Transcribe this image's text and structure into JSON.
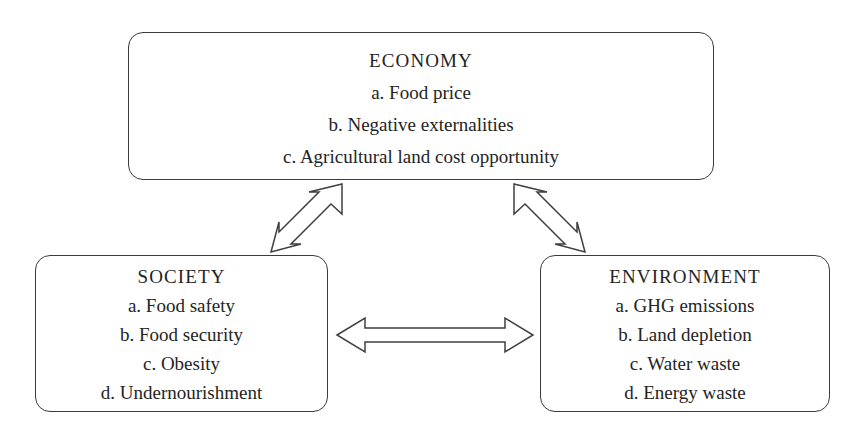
{
  "diagram": {
    "background_color": "#ffffff",
    "stroke_color": "#3f3f3f",
    "text_color": "#242424",
    "nodes": [
      {
        "id": "economy",
        "title": "ECONOMY",
        "items": [
          "a. Food price",
          "b. Negative externalities",
          "c. Agricultural land cost opportunity"
        ]
      },
      {
        "id": "society",
        "title": "SOCIETY",
        "items": [
          "a. Food safety",
          "b. Food security",
          "c. Obesity",
          "d. Undernourishment"
        ]
      },
      {
        "id": "environment",
        "title": "ENVIRONMENT",
        "items": [
          "a. GHG emissions",
          "b. Land depletion",
          "c. Water waste",
          "d. Energy waste"
        ]
      }
    ],
    "connectors": [
      {
        "id": "economy-society",
        "from": "ECONOMY",
        "to": "SOCIETY",
        "style": "double-headed-arrow",
        "orientation": "diagonal-up-right"
      },
      {
        "id": "economy-environment",
        "from": "ECONOMY",
        "to": "ENVIRONMENT",
        "style": "double-headed-arrow",
        "orientation": "diagonal-up-left"
      },
      {
        "id": "society-environment",
        "from": "SOCIETY",
        "to": "ENVIRONMENT",
        "style": "double-headed-arrow",
        "orientation": "horizontal"
      }
    ]
  }
}
